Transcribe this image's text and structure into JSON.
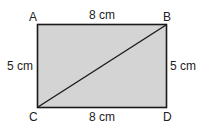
{
  "diagram": {
    "shape": "rectangle",
    "fill_color": "#d4d4d4",
    "stroke_color": "#1a1a1a",
    "vertices": {
      "A": "A",
      "B": "B",
      "C": "C",
      "D": "D"
    },
    "diagonal": "CB",
    "sides": {
      "top": "8 cm",
      "bottom": "8 cm",
      "left": "5 cm",
      "right": "5 cm"
    }
  }
}
